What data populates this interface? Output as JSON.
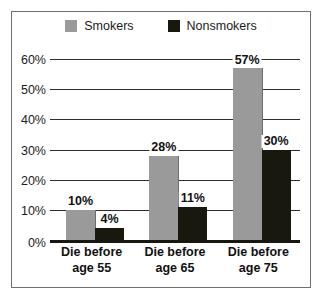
{
  "chart_data": {
    "type": "bar",
    "title": "",
    "xlabel": "",
    "ylabel": "",
    "ylim": [
      0,
      60
    ],
    "grid": true,
    "legend_position": "top-center",
    "categories": [
      "Die before age 55",
      "Die before age 65",
      "Die before age 75"
    ],
    "category_lines": [
      [
        "Die before",
        "age 55"
      ],
      [
        "Die before",
        "age 65"
      ],
      [
        "Die before",
        "age 75"
      ]
    ],
    "ytick_labels": [
      "60%",
      "50%",
      "40%",
      "30%",
      "20%",
      "10%",
      "0%"
    ],
    "ytick_values": [
      60,
      50,
      40,
      30,
      20,
      10,
      0
    ],
    "series": [
      {
        "name": "Smokers",
        "color": "#9a9a9a",
        "values": [
          10,
          28,
          57
        ],
        "data_labels": [
          "10%",
          "28%",
          "57%"
        ]
      },
      {
        "name": "Nonsmokers",
        "color": "#18180f",
        "values": [
          4,
          11,
          30
        ],
        "data_labels": [
          "4%",
          "11%",
          "30%"
        ]
      }
    ]
  },
  "legend": {
    "entries": [
      {
        "label": "Smokers",
        "swatch": "gray-square-swatch"
      },
      {
        "label": "Nonsmokers",
        "swatch": "black-square-swatch"
      }
    ]
  },
  "colors": {
    "smokers": "#9a9a9a",
    "nonsmokers": "#18180f",
    "gridline": "#2d2d2d",
    "frame": "#6f7174",
    "text": "#1b1b1b"
  }
}
